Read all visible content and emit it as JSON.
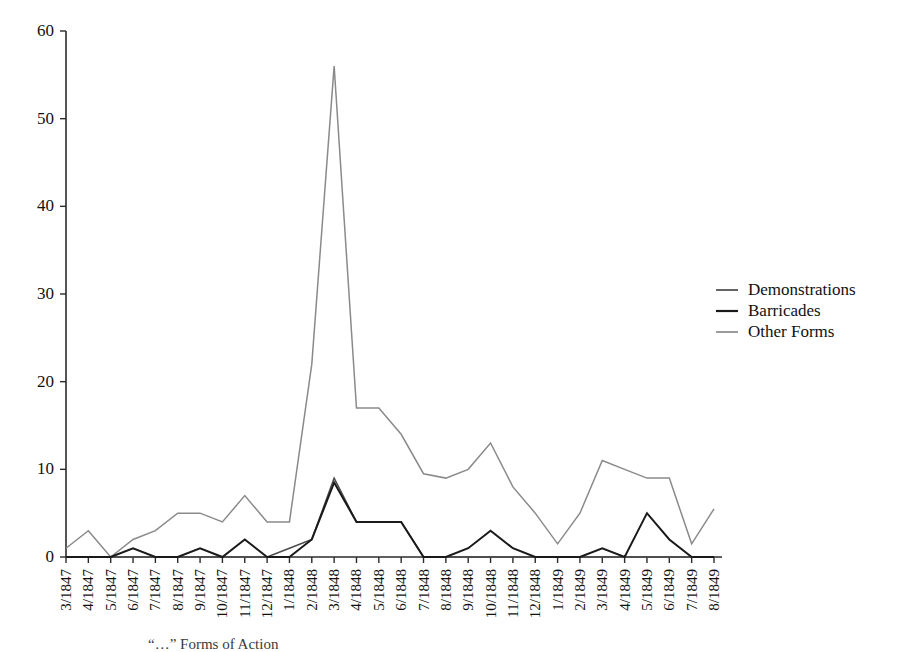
{
  "chart_data": {
    "type": "line",
    "title": "",
    "xlabel": "",
    "ylabel": "",
    "ylim": [
      0,
      60
    ],
    "yticks": [
      0,
      10,
      20,
      30,
      40,
      50,
      60
    ],
    "grid": false,
    "legend_position": "right",
    "categories": [
      "3/1847",
      "4/1847",
      "5/1847",
      "6/1847",
      "7/1847",
      "8/1847",
      "9/1847",
      "10/1847",
      "11/1847",
      "12/1847",
      "1/1848",
      "2/1848",
      "3/1848",
      "4/1848",
      "5/1848",
      "6/1848",
      "7/1848",
      "8/1848",
      "9/1848",
      "10/1848",
      "11/1848",
      "12/1848",
      "1/1849",
      "2/1849",
      "3/1849",
      "4/1849",
      "5/1849",
      "6/1849",
      "7/1849",
      "8/1849"
    ],
    "series": [
      {
        "name": "Demonstrations",
        "color": "#4a4a4a",
        "values": [
          0,
          0,
          0,
          0,
          0,
          0,
          0,
          0,
          0,
          0,
          1,
          2,
          9,
          4,
          4,
          4,
          0,
          0,
          0,
          0,
          0,
          0,
          0,
          0,
          0,
          0,
          0,
          0,
          0,
          0
        ]
      },
      {
        "name": "Barricades",
        "color": "#1a1a1a",
        "values": [
          0,
          0,
          0,
          1,
          0,
          0,
          1,
          0,
          2,
          0,
          0,
          2,
          8.5,
          4,
          4,
          4,
          0,
          0,
          1,
          3,
          1,
          0,
          0,
          0,
          1,
          0,
          5,
          2,
          0,
          0
        ]
      },
      {
        "name": "Other Forms",
        "color": "#8a8a8a",
        "values": [
          1,
          3,
          0,
          2,
          3,
          5,
          5,
          4,
          7,
          4,
          4,
          22,
          56,
          17,
          17,
          14,
          9.5,
          9,
          10,
          13,
          8,
          5,
          1.5,
          5,
          11,
          10,
          9,
          9,
          1.5,
          5.5
        ]
      }
    ]
  },
  "legend": {
    "items": [
      {
        "label": "Demonstrations",
        "color": "#4a4a4a"
      },
      {
        "label": "Barricades",
        "color": "#1a1a1a"
      },
      {
        "label": "Other Forms",
        "color": "#8a8a8a"
      }
    ]
  },
  "caption": {
    "text": "“…” Forms of Action"
  }
}
